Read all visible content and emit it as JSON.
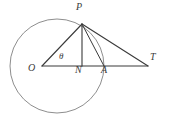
{
  "figure": {
    "background_color": "#ffffff",
    "stroke_color_lines": "#3a3a3a",
    "stroke_color_circle": "#8e8e8e",
    "label_color": "#3b3b3b"
  },
  "circle": {
    "name": "circle-O",
    "center_x": 57,
    "center_y": 66,
    "radius": 47,
    "stroke": "#8e8e8e",
    "stroke_width": 1
  },
  "points": {
    "O": {
      "label": "O",
      "x": 42,
      "y": 66,
      "label_x": 30,
      "label_y": 68
    },
    "P": {
      "label": "P",
      "x": 82,
      "y": 24,
      "label_x": 78,
      "label_y": 7
    },
    "N": {
      "label": "N",
      "x": 82,
      "y": 66,
      "label_x": 77,
      "label_y": 70
    },
    "A": {
      "label": "A",
      "x": 104,
      "y": 66,
      "label_x": 103,
      "label_y": 70
    },
    "T": {
      "label": "T",
      "x": 148,
      "y": 66,
      "label_x": 152,
      "label_y": 57
    }
  },
  "angle": {
    "label": "θ",
    "vertex": "O",
    "label_x": 60,
    "label_y": 54
  },
  "segments": [
    {
      "name": "segment-OT",
      "from": "O",
      "to": "T",
      "x1": 42,
      "y1": 66,
      "x2": 148,
      "y2": 66
    },
    {
      "name": "segment-OP",
      "from": "O",
      "to": "P",
      "x1": 42,
      "y1": 66,
      "x2": 82,
      "y2": 24
    },
    {
      "name": "segment-PN",
      "from": "P",
      "to": "N",
      "x1": 82,
      "y1": 24,
      "x2": 82,
      "y2": 66
    },
    {
      "name": "segment-PT",
      "from": "P",
      "to": "T",
      "x1": 82,
      "y1": 24,
      "x2": 148,
      "y2": 66
    },
    {
      "name": "segment-PA",
      "from": "P",
      "to": "A",
      "x1": 82,
      "y1": 24,
      "x2": 104,
      "y2": 66
    }
  ]
}
